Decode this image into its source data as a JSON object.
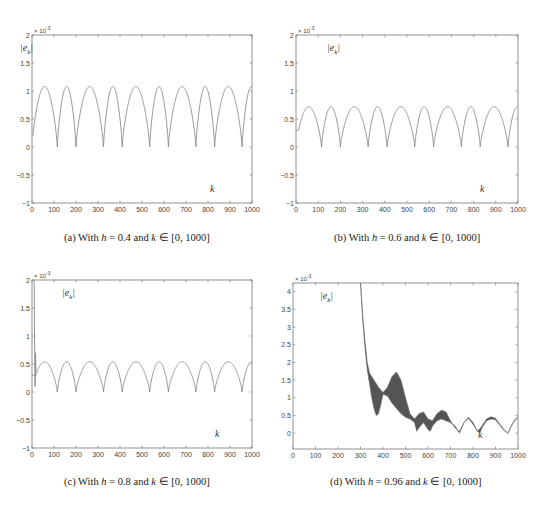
{
  "figure": {
    "panels": [
      {
        "id": "a",
        "caption_prefix": "(a) With ",
        "h_label": "h",
        "h_value": "0.4",
        "k_label": "k",
        "range": "[0, 1000]"
      },
      {
        "id": "b",
        "caption_prefix": "(b) With ",
        "h_label": "h",
        "h_value": "0.6",
        "k_label": "k",
        "range": "[0, 1000]"
      },
      {
        "id": "c",
        "caption_prefix": "(c) With ",
        "h_label": "h",
        "h_value": "0.8",
        "k_label": "k",
        "range": "[0, 1000]"
      },
      {
        "id": "d",
        "caption_prefix": "(d) With ",
        "h_label": "h",
        "h_value": "0.96",
        "k_label": "k",
        "range": "[0, 1000]"
      }
    ],
    "caption_connector": " and ",
    "caption_in_symbol": " ∈ ",
    "caption_eq": " = ",
    "y_label": "|e_k|",
    "x_label": "k",
    "y_scale_label": "× 10",
    "y_scale_exp": "-3",
    "line_color": "#8a8a8a",
    "band_color": "#555555"
  },
  "chart_data": [
    {
      "type": "line",
      "title": "(a) With h = 0.4 and k ∈ [0, 1000]",
      "xlabel": "k",
      "ylabel": "|e_k|",
      "y_multiplier": "x 10^-3",
      "xlim": [
        0,
        1000
      ],
      "ylim": [
        -1,
        2
      ],
      "xticks": [
        0,
        100,
        200,
        300,
        400,
        500,
        600,
        700,
        800,
        900,
        1000
      ],
      "yticks": [
        -1,
        -0.5,
        0,
        0.5,
        1,
        1.5,
        2
      ],
      "ytick_labels": [
        "-1",
        "-0.5",
        "0",
        "0.5",
        "1",
        "1.5",
        "2"
      ],
      "peak": 1.08,
      "zeros_k": [
        0,
        115,
        200,
        325,
        410,
        535,
        620,
        745,
        830,
        955,
        1040
      ],
      "start_value": 0.2
    },
    {
      "type": "line",
      "title": "(b) With h = 0.6 and k ∈ [0, 1000]",
      "xlabel": "k",
      "ylabel": "|e_k|",
      "y_multiplier": "x 10^-3",
      "xlim": [
        0,
        1000
      ],
      "ylim": [
        -1,
        2
      ],
      "xticks": [
        0,
        100,
        200,
        300,
        400,
        500,
        600,
        700,
        800,
        900,
        1000
      ],
      "yticks": [
        -1,
        -0.5,
        0,
        0.5,
        1,
        1.5,
        2
      ],
      "ytick_labels": [
        "-1",
        "-0.5",
        "0",
        "0.5",
        "1",
        "1.5",
        "2"
      ],
      "peak": 0.72,
      "zeros_k": [
        0,
        115,
        200,
        325,
        410,
        535,
        620,
        745,
        830,
        955,
        1040
      ],
      "start_value": 0.3
    },
    {
      "type": "line",
      "title": "(c) With h = 0.8 and k ∈ [0, 1000]",
      "xlabel": "k",
      "ylabel": "|e_k|",
      "y_multiplier": "x 10^-3",
      "xlim": [
        0,
        1000
      ],
      "ylim": [
        -1,
        2
      ],
      "xticks": [
        0,
        100,
        200,
        300,
        400,
        500,
        600,
        700,
        800,
        900,
        1000
      ],
      "yticks": [
        -1,
        -0.5,
        0,
        0.5,
        1,
        1.5,
        2
      ],
      "ytick_labels": [
        "-1",
        "-0.5",
        "0",
        "0.5",
        "1",
        "1.5",
        "2"
      ],
      "peak": 0.54,
      "zeros_k": [
        0,
        115,
        200,
        325,
        410,
        535,
        620,
        745,
        830,
        955,
        1040
      ],
      "start_value": 0.3,
      "initial_spike": {
        "k": [
          10,
          12,
          14,
          16,
          18
        ],
        "values": [
          2.0,
          0.8,
          0.1,
          0.7,
          0.35
        ]
      }
    },
    {
      "type": "area",
      "title": "(d) With h = 0.96 and k ∈ [0, 1000]",
      "xlabel": "k",
      "ylabel": "|e_k|",
      "y_multiplier": "x 10^-3",
      "xlim": [
        0,
        1000
      ],
      "ylim": [
        -0.45,
        4.25
      ],
      "xticks": [
        0,
        100,
        200,
        300,
        400,
        500,
        600,
        700,
        800,
        900,
        1000
      ],
      "yticks": [
        0,
        0.5,
        1,
        1.5,
        2,
        2.5,
        3,
        3.5,
        4
      ],
      "ytick_labels": [
        "0",
        "0.5",
        "1",
        "1.5",
        "2",
        "2.5",
        "3",
        "3.5",
        "4"
      ],
      "upper_envelope": {
        "k": [
          300,
          310,
          320,
          330,
          340,
          360,
          380,
          400,
          420,
          440,
          460,
          480,
          500,
          520,
          540,
          560,
          580,
          600,
          620,
          640,
          660,
          680,
          700,
          720,
          740,
          760,
          780,
          800,
          820,
          840,
          860,
          880,
          900,
          920,
          940,
          955,
          970,
          985,
          1000
        ],
        "values": [
          4.25,
          3.3,
          2.6,
          2.0,
          1.7,
          1.5,
          1.3,
          1.15,
          1.3,
          1.6,
          1.73,
          1.5,
          1.0,
          0.55,
          0.4,
          0.55,
          0.6,
          0.4,
          0.35,
          0.55,
          0.65,
          0.6,
          0.35,
          0.15,
          0.05,
          0.3,
          0.45,
          0.3,
          0.05,
          0.2,
          0.4,
          0.46,
          0.42,
          0.25,
          0.08,
          0.0,
          0.2,
          0.38,
          0.45
        ]
      },
      "lower_envelope": {
        "k": [
          300,
          310,
          320,
          330,
          340,
          350,
          360,
          370,
          380,
          390,
          400,
          420,
          440,
          460,
          480,
          500,
          520,
          540,
          550,
          560,
          580,
          600,
          610,
          620,
          640,
          660,
          680,
          700,
          720,
          740,
          760,
          780,
          800,
          820,
          830,
          840,
          860,
          880,
          900,
          920,
          940,
          955,
          970,
          985,
          1000
        ],
        "values": [
          4.25,
          3.2,
          2.4,
          1.8,
          1.4,
          1.0,
          0.7,
          0.5,
          0.55,
          0.8,
          1.1,
          1.05,
          0.85,
          0.7,
          0.55,
          0.45,
          0.4,
          0.3,
          0.05,
          0.15,
          0.3,
          0.1,
          0.05,
          0.2,
          0.35,
          0.4,
          0.35,
          0.3,
          0.2,
          0.0,
          0.3,
          0.42,
          0.25,
          0.05,
          0.0,
          0.15,
          0.35,
          0.4,
          0.38,
          0.22,
          0.06,
          0.0,
          0.2,
          0.36,
          0.44
        ]
      }
    }
  ]
}
